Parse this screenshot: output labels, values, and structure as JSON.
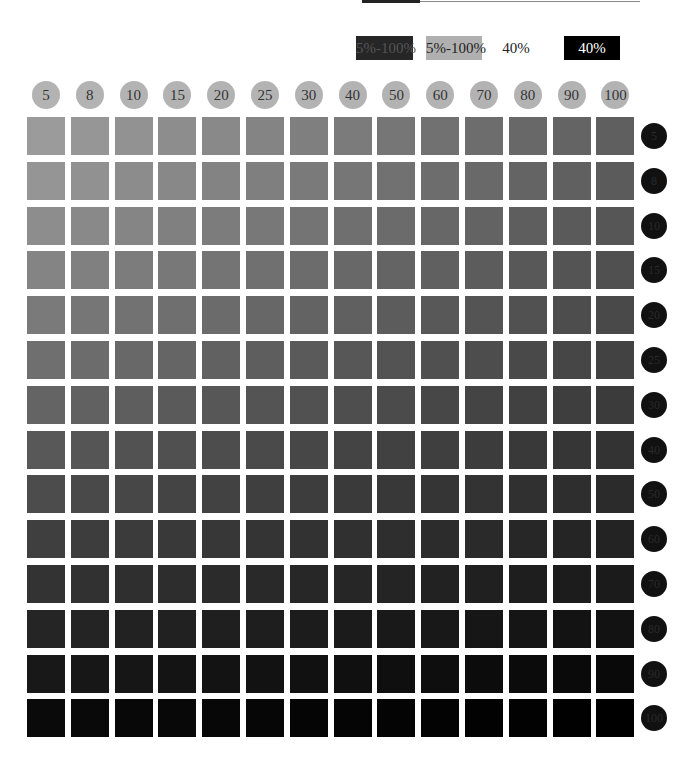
{
  "chart_data": {
    "type": "heatmap",
    "title": "",
    "columns": [
      5,
      8,
      10,
      15,
      20,
      25,
      30,
      40,
      50,
      60,
      70,
      80,
      90,
      100
    ],
    "rows": [
      5,
      8,
      10,
      15,
      20,
      25,
      30,
      40,
      50,
      60,
      70,
      80,
      90,
      100
    ],
    "legend": [
      {
        "label": "5%-100%",
        "bg": "#262626",
        "fg": "#555555"
      },
      {
        "label": "5%-100%",
        "bg": "#b0b0b0",
        "fg": "#222222"
      },
      {
        "label": "40%",
        "bg": "#ffffff",
        "fg": "#222222"
      },
      {
        "label": "40%",
        "bg": "#000000",
        "fg": "#ffffff"
      }
    ],
    "corner_colors": {
      "top_left": "#9b9b9b",
      "top_right": "#5f5f5f",
      "bottom_left": "#0a0a0a",
      "bottom_right": "#000000"
    }
  },
  "header_circle_color": "#b3b3b3",
  "row_circle_color": "#111111"
}
